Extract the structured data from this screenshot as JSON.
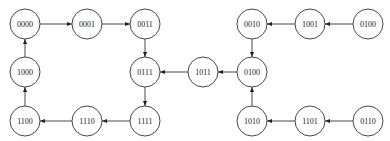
{
  "diagram": {
    "type": "state-transition-graph",
    "node_radius": 15,
    "colors": {
      "stroke": "#333333",
      "fill": "#ffffff",
      "text": "#222222"
    },
    "nodes": [
      {
        "id": "n0000",
        "label": "0000",
        "x": 25,
        "y": 24
      },
      {
        "id": "n0001",
        "label": "0001",
        "x": 87,
        "y": 24
      },
      {
        "id": "n0011",
        "label": "0011",
        "x": 145,
        "y": 24
      },
      {
        "id": "n1000",
        "label": "1000",
        "x": 25,
        "y": 72
      },
      {
        "id": "n0111",
        "label": "0111",
        "x": 145,
        "y": 72
      },
      {
        "id": "n1100",
        "label": "1100",
        "x": 25,
        "y": 121
      },
      {
        "id": "n1110",
        "label": "1110",
        "x": 87,
        "y": 121
      },
      {
        "id": "n1111",
        "label": "1111",
        "x": 145,
        "y": 121
      },
      {
        "id": "n1011",
        "label": "1011",
        "x": 203,
        "y": 72
      },
      {
        "id": "n0100a",
        "label": "0100",
        "x": 252,
        "y": 72
      },
      {
        "id": "n0010",
        "label": "0010",
        "x": 252,
        "y": 24
      },
      {
        "id": "n1001",
        "label": "1001",
        "x": 310,
        "y": 24
      },
      {
        "id": "n0100b",
        "label": "0100",
        "x": 368,
        "y": 24
      },
      {
        "id": "n1010",
        "label": "1010",
        "x": 252,
        "y": 121
      },
      {
        "id": "n1101",
        "label": "1101",
        "x": 310,
        "y": 121
      },
      {
        "id": "n0110",
        "label": "0110",
        "x": 368,
        "y": 121
      }
    ],
    "edges": [
      {
        "from": "n0000",
        "to": "n0001"
      },
      {
        "from": "n0001",
        "to": "n0011"
      },
      {
        "from": "n0011",
        "to": "n0111"
      },
      {
        "from": "n0111",
        "to": "n1111"
      },
      {
        "from": "n1111",
        "to": "n1110"
      },
      {
        "from": "n1110",
        "to": "n1100"
      },
      {
        "from": "n1100",
        "to": "n1000"
      },
      {
        "from": "n1000",
        "to": "n0000"
      },
      {
        "from": "n1011",
        "to": "n0111"
      },
      {
        "from": "n0100a",
        "to": "n1011"
      },
      {
        "from": "n0010",
        "to": "n0100a"
      },
      {
        "from": "n1001",
        "to": "n0010"
      },
      {
        "from": "n0100b",
        "to": "n1001"
      },
      {
        "from": "n1010",
        "to": "n0100a"
      },
      {
        "from": "n1101",
        "to": "n1010"
      },
      {
        "from": "n0110",
        "to": "n1101"
      }
    ]
  }
}
